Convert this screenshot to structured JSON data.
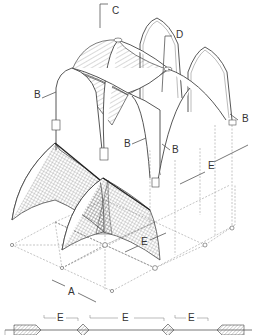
{
  "diagram": {
    "labels": {
      "A": "A",
      "B": "B",
      "C": "C",
      "D": "D",
      "E": "E"
    },
    "callouts": [
      {
        "id": "label-c-top",
        "text": "C",
        "x": 112,
        "y": 14
      },
      {
        "id": "label-d",
        "text": "D",
        "x": 176,
        "y": 38
      },
      {
        "id": "label-b-left",
        "text": "B",
        "x": 35,
        "y": 97
      },
      {
        "id": "label-b-right-top",
        "text": "B",
        "x": 244,
        "y": 121
      },
      {
        "id": "label-b-mid-left",
        "text": "B",
        "x": 126,
        "y": 146
      },
      {
        "id": "label-b-mid-right",
        "text": "B",
        "x": 174,
        "y": 152
      },
      {
        "id": "label-e-right",
        "text": "E",
        "x": 210,
        "y": 166
      },
      {
        "id": "label-e-mid",
        "text": "E",
        "x": 144,
        "y": 243
      },
      {
        "id": "label-a",
        "text": "A",
        "x": 70,
        "y": 293
      },
      {
        "id": "label-e-sec-1",
        "text": "E",
        "x": 60,
        "y": 318
      },
      {
        "id": "label-e-sec-2",
        "text": "E",
        "x": 126,
        "y": 318
      },
      {
        "id": "label-e-sec-3",
        "text": "E",
        "x": 191,
        "y": 318
      }
    ],
    "colors": {
      "line": "#555555",
      "hatch": "#666666",
      "background": "#ffffff"
    }
  }
}
